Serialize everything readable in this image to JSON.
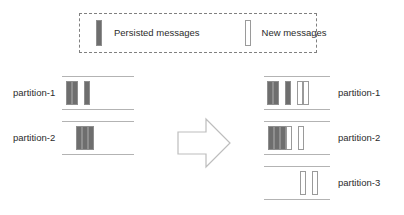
{
  "legend": {
    "entries": [
      {
        "icon": "persisted-message-bar",
        "label": "Persisted messages",
        "style": "persisted",
        "color": "#6e6e6e"
      },
      {
        "icon": "new-message-bar",
        "label": "New messages",
        "style": "new",
        "color": "#ffffff"
      }
    ],
    "border_color": "#808080"
  },
  "diagram": {
    "arrow_icon": "right-arrow-icon",
    "before": {
      "partitions": [
        {
          "label": "partition-1",
          "slots": [
            "persisted",
            "persisted",
            "gap",
            "persisted"
          ]
        },
        {
          "label": "partition-2",
          "slots": [
            "persisted",
            "persisted",
            "persisted"
          ]
        }
      ]
    },
    "after": {
      "partitions": [
        {
          "label": "partition-1",
          "slots": [
            "persisted",
            "persisted",
            "gap",
            "persisted",
            "gap",
            "new",
            "new"
          ]
        },
        {
          "label": "partition-2",
          "slots": [
            "persisted",
            "persisted",
            "persisted",
            "new",
            "gap",
            "new"
          ]
        },
        {
          "label": "partition-3",
          "slots": [
            "new",
            "new"
          ]
        }
      ]
    }
  }
}
